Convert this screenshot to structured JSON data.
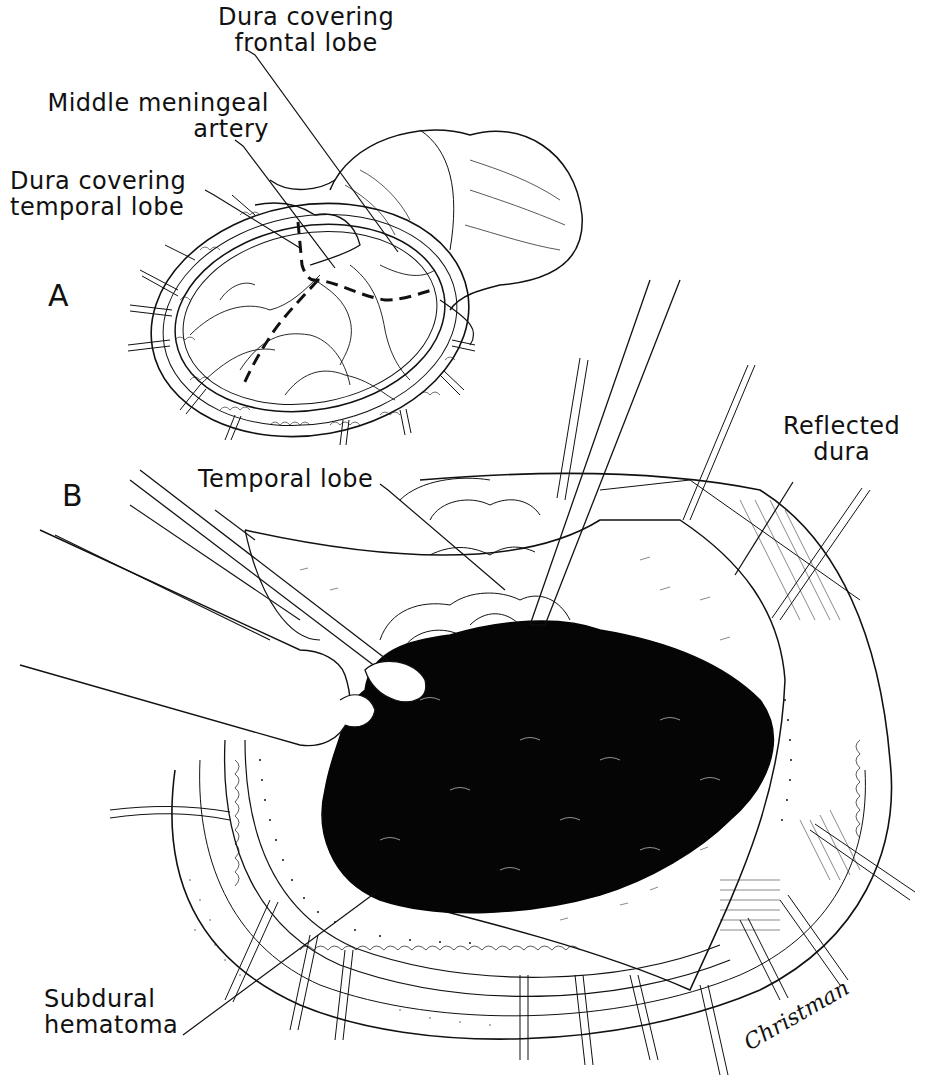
{
  "figure": {
    "panels": [
      {
        "id": "A",
        "letter": "A"
      },
      {
        "id": "B",
        "letter": "B"
      }
    ],
    "labels": {
      "dura_frontal": {
        "line1": "Dura covering",
        "line2": "frontal lobe"
      },
      "middle_meningeal": {
        "line1": "Middle meningeal",
        "line2": "artery"
      },
      "dura_temporal": {
        "line1": "Dura covering",
        "line2": "temporal lobe"
      },
      "temporal_lobe": {
        "line1": "Temporal lobe"
      },
      "reflected_dura": {
        "line1": "Reflected",
        "line2": "dura"
      },
      "subdural_hematoma": {
        "line1": "Subdural",
        "line2": "hematoma"
      }
    },
    "signature": "Christman",
    "colors": {
      "ink": "#111111",
      "background": "#ffffff",
      "hematoma": "#050505"
    }
  }
}
